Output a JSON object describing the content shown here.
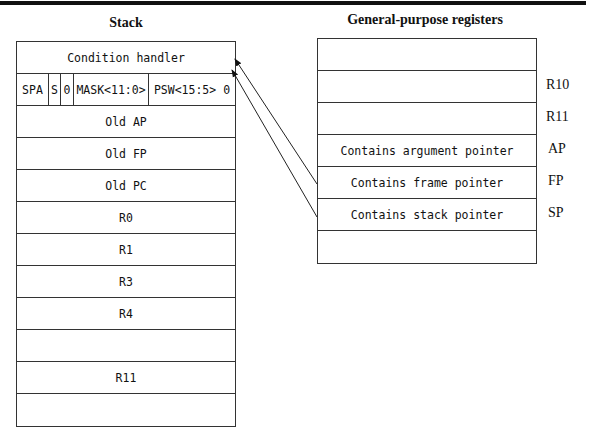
{
  "stack": {
    "title": "Stack",
    "rows": [
      {
        "label": "Condition handler"
      },
      {
        "segments": [
          "SPA",
          "S",
          "0",
          "MASK<11:0>",
          "PSW<15:5> 0"
        ]
      },
      {
        "label": "Old AP"
      },
      {
        "label": "Old FP"
      },
      {
        "label": "Old PC"
      },
      {
        "label": "R0"
      },
      {
        "label": "R1"
      },
      {
        "label": "R3"
      },
      {
        "label": "R4"
      },
      {
        "label": ""
      },
      {
        "label": "R11"
      },
      {
        "label": ""
      }
    ]
  },
  "registers": {
    "title": "General-purpose registers",
    "rows": [
      {
        "content": "",
        "name": ""
      },
      {
        "content": "",
        "name": "R10"
      },
      {
        "content": "",
        "name": "R11"
      },
      {
        "content": "Contains argument pointer",
        "name": "AP"
      },
      {
        "content": "Contains frame pointer",
        "name": "FP"
      },
      {
        "content": "Contains stack pointer",
        "name": "SP"
      },
      {
        "content": "",
        "name": ""
      }
    ]
  },
  "arrows": [
    {
      "from": "FP",
      "to": "Condition handler top-right"
    },
    {
      "from": "SP",
      "to": "Condition handler bottom-right"
    }
  ]
}
